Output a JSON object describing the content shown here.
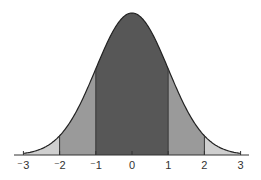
{
  "chart_data": {
    "type": "area",
    "title": "",
    "xlabel": "",
    "ylabel": "",
    "xlim": [
      -3.2,
      3.2
    ],
    "ticks": [
      -3,
      -2,
      -1,
      0,
      1,
      2,
      3
    ],
    "tick_labels": [
      "⁻3",
      "⁻2",
      "⁻1",
      "0",
      "1",
      "2",
      "3"
    ],
    "grid": false,
    "legend": null,
    "regions": [
      {
        "from": -3,
        "to": -2,
        "shade": "light",
        "color": "#cfcfcf"
      },
      {
        "from": -2,
        "to": -1,
        "shade": "medium",
        "color": "#9a9a9a"
      },
      {
        "from": -1,
        "to": 1,
        "shade": "dark",
        "color": "#575757"
      },
      {
        "from": 1,
        "to": 2,
        "shade": "medium",
        "color": "#9a9a9a"
      },
      {
        "from": 2,
        "to": 3,
        "shade": "light",
        "color": "#cfcfcf"
      }
    ],
    "curve": {
      "mean": 0,
      "sd": 1,
      "stroke": "#222222"
    }
  }
}
